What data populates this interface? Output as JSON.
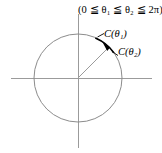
{
  "figure": {
    "title_note": "(0 ≦ θ₁ ≦ θ₂ ≦ 2π)",
    "condition": {
      "full_text": "(0 ≦ θ₁ ≦ θ₂ ≦ 2π)",
      "open_paren": "(",
      "lower_bound": "0",
      "rel1": "≦",
      "var1": "θ",
      "var1_sub": "1",
      "rel2": "≦",
      "var2": "θ",
      "var2_sub": "2",
      "rel3": "≦",
      "upper_bound": "2π",
      "close_paren": ")"
    },
    "labels": {
      "c_theta1": {
        "fn": "C",
        "open": "(",
        "var": "θ",
        "sub": "1",
        "close": ")",
        "full_text": "C(θ₁)"
      },
      "c_theta2": {
        "fn": "C",
        "open": "(",
        "var": "θ",
        "sub": "2",
        "close": ")",
        "full_text": "C(θ₂)"
      }
    },
    "geometry": {
      "center_x": 78,
      "center_y": 78,
      "radius": 44,
      "x_axis_start_x": 11,
      "x_axis_end_x": 152,
      "y_axis_start_y": 14,
      "y_axis_end_y": 148,
      "radius_line_angle_deg": 45,
      "arc_start_angle_deg": 66,
      "arc_end_angle_deg": 36,
      "arrow_tip_angle_deg": 45
    },
    "colors": {
      "background": "#ffffff",
      "axis": "#9b9b9b",
      "circle": "#8c8c8c",
      "radius_line": "#9b9b9b",
      "arc_highlight": "#000000",
      "text": "#000000"
    }
  }
}
